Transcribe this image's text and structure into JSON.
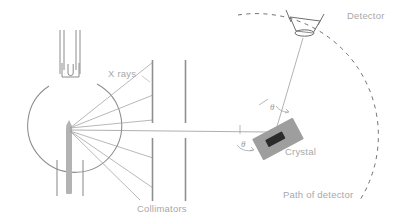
{
  "figure": {
    "type": "x-ray-diffractometer-schematic",
    "canvas": {
      "width": 401,
      "height": 223,
      "background": "#ffffff"
    },
    "labels": {
      "x_rays": "X rays",
      "collimators": "Collimators",
      "crystal": "Crystal",
      "detector": "Detector",
      "path_of_detector": "Path of detector",
      "theta_incident": "θ",
      "theta_reflected": "θ"
    },
    "colors": {
      "outline": "#8c8c8c",
      "beam": "#a0a0a0",
      "label_text": "#a8a8a8",
      "target_fill": "#b3b3b3",
      "crystal_fill": "#9e9e9e",
      "crystal_slot": "#2b2b2b",
      "collimator": "#8f8f8f",
      "dashed_path": "#6e6e6e"
    },
    "components": [
      {
        "name": "x-ray-tube",
        "description": "evacuated glass bulb with vertical neck and filament",
        "cx": 72,
        "cy": 118,
        "r": 47
      },
      {
        "name": "target-anode",
        "description": "vertical rod target inside bulb",
        "x": 66,
        "y": 124,
        "width": 6,
        "height": 70
      },
      {
        "name": "collimator-first",
        "x": 152,
        "gap_top": 123,
        "gap_bottom": 138
      },
      {
        "name": "collimator-second",
        "x": 185,
        "gap_top": 123,
        "gap_bottom": 138
      },
      {
        "name": "crystal",
        "cx": 278,
        "cy": 139,
        "rotation_deg": -28
      },
      {
        "name": "detector",
        "cx": 305,
        "cy": 24
      },
      {
        "name": "detector-path-arc",
        "center_x": 278,
        "center_y": 139,
        "radius": 120,
        "style": "dashed"
      }
    ],
    "beams": {
      "source_x": 70,
      "source_y": 128,
      "count": 6,
      "description": "divergent X-ray fan from target through collimators"
    },
    "angles": {
      "incident_theta_label_x": 243,
      "incident_theta_label_y": 145,
      "reflected_theta_label_x": 272,
      "reflected_theta_label_y": 110
    }
  }
}
